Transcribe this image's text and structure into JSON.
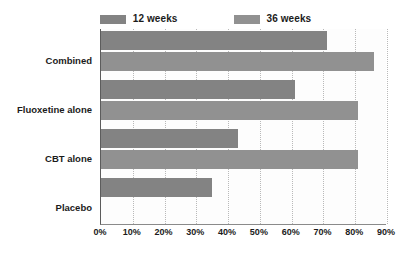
{
  "chart_data": {
    "type": "bar",
    "orientation": "horizontal",
    "title": "",
    "xlabel": "",
    "ylabel": "",
    "xlim": [
      0,
      90
    ],
    "xticks": [
      "0%",
      "10%",
      "20%",
      "30%",
      "40%",
      "50%",
      "60%",
      "70%",
      "80%",
      "90%"
    ],
    "xtick_values": [
      0,
      10,
      20,
      30,
      40,
      50,
      60,
      70,
      80,
      90
    ],
    "grid": true,
    "grid_axis": "x",
    "legend_position": "top",
    "categories": [
      "Combined",
      "Fluoxetine alone",
      "CBT alone",
      "Placebo"
    ],
    "series": [
      {
        "name": "12 weeks",
        "color": "#838383",
        "values": [
          71,
          61,
          43,
          35
        ]
      },
      {
        "name": "36 weeks",
        "color": "#919191",
        "values": [
          86,
          81,
          81,
          null
        ]
      }
    ]
  },
  "legend": {
    "entries": [
      {
        "label": "12 weeks",
        "swatch_name": "legend-swatch-12-weeks"
      },
      {
        "label": "36 weeks",
        "swatch_name": "legend-swatch-36-weeks"
      }
    ]
  },
  "axis": {
    "x_tick_labels": [
      "0%",
      "10%",
      "20%",
      "30%",
      "40%",
      "50%",
      "60%",
      "70%",
      "80%",
      "90%"
    ],
    "y_category_labels": [
      "Combined",
      "Fluoxetine alone",
      "CBT alone",
      "Placebo"
    ]
  },
  "colors": {
    "series_12_weeks": "#838383",
    "series_36_weeks": "#919191",
    "axis_line": "#5c5c5c",
    "gridline": "#b9b9b9",
    "text": "#1b1b1b",
    "background": "#ffffff"
  }
}
